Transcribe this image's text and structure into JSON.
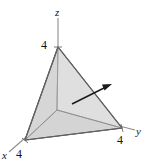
{
  "figure": {
    "background_color": "#ffffff",
    "stroke_color": "#6b6b6b",
    "text_color": "#141414",
    "axes": [
      {
        "name": "z",
        "label": "z",
        "intercept_label": "4"
      },
      {
        "name": "y",
        "label": "y",
        "intercept_label": "4"
      },
      {
        "name": "x",
        "label": "x",
        "intercept_label": "4"
      }
    ],
    "solid": {
      "name": "tetrahedron",
      "faces": [
        {
          "name": "front-left-face",
          "fill": "#d3d3d3"
        },
        {
          "name": "front-right-face",
          "fill": "#ececec"
        },
        {
          "name": "base-left-face",
          "fill": "#b8b8b8"
        },
        {
          "name": "base-right-face",
          "fill": "#c9c9c9"
        }
      ]
    },
    "normal_vector": {
      "name": "normal-arrow",
      "color": "#1a1a1a",
      "direction": "up-right"
    }
  }
}
